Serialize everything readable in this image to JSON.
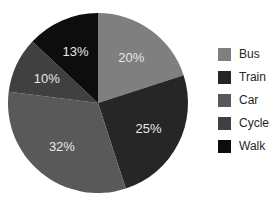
{
  "chart_data": {
    "type": "pie",
    "title": "",
    "categories": [
      "Bus",
      "Train",
      "Car",
      "Cycle",
      "Walk"
    ],
    "values": [
      20,
      25,
      32,
      10,
      13
    ],
    "slice_labels": [
      "20%",
      "25%",
      "32%",
      "10%",
      "13%"
    ],
    "colors": [
      "#7f7f7f",
      "#262626",
      "#595959",
      "#404040",
      "#0d0d0d"
    ],
    "slice_label_color": "#e8e8e8",
    "legend_text_color": "#262626",
    "background_color": "#ffffff",
    "legend_position": "right",
    "start_angle_deg": 0,
    "direction": "clockwise"
  }
}
